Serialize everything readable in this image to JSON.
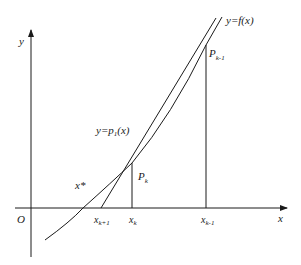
{
  "diagram": {
    "colors": {
      "stroke": "#1a1a1a",
      "background": "#ffffff"
    },
    "axes": {
      "x_label": "x",
      "y_label": "y",
      "origin_label": "O"
    },
    "curves": {
      "function_label": "y=f(x)",
      "secant_label_prefix": "y=p",
      "secant_label_sub": "1",
      "secant_label_suffix": "(x)"
    },
    "points": {
      "pk_main": "P",
      "pk_sub": "k",
      "pk1_main": "P",
      "pk1_sub": "k-1"
    },
    "ticks": {
      "xk1_main": "x",
      "xk1_sub": "k+1",
      "xk_main": "x",
      "xk_sub": "k",
      "xkm1_main": "x",
      "xkm1_sub": "k-1"
    },
    "root_label": "x*"
  }
}
